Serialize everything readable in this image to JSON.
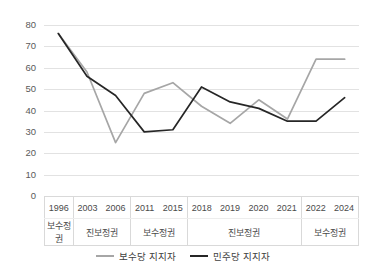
{
  "chart_data": {
    "type": "line",
    "title": "",
    "xlabel": "",
    "ylabel": "",
    "ylim": [
      0,
      80
    ],
    "ytick_step": 10,
    "ytick_labels": [
      "80",
      "70",
      "60",
      "50",
      "40",
      "30",
      "20",
      "10",
      "0"
    ],
    "grid": true,
    "legend_position": "bottom",
    "categories": [
      "1996",
      "2003",
      "2006",
      "2011",
      "2015",
      "2018",
      "2019",
      "2020",
      "2021",
      "2022",
      "2024"
    ],
    "group_bands": [
      {
        "label": "보수정권",
        "categories": [
          "1996"
        ]
      },
      {
        "label": "진보정권",
        "categories": [
          "2003",
          "2006"
        ]
      },
      {
        "label": "보수정권",
        "categories": [
          "2011",
          "2015"
        ]
      },
      {
        "label": "진보정권",
        "categories": [
          "2018",
          "2019",
          "2020",
          "2021"
        ]
      },
      {
        "label": "보수정권",
        "categories": [
          "2022",
          "2024"
        ]
      }
    ],
    "series": [
      {
        "name": "보수당 지지자",
        "color": "#a6a6a6",
        "values": [
          76,
          58,
          25,
          48,
          53,
          42,
          34,
          45,
          36,
          64,
          64
        ]
      },
      {
        "name": "민주당 지지자",
        "color": "#262626",
        "values": [
          76,
          56,
          47,
          30,
          31,
          51,
          44,
          41,
          35,
          35,
          46
        ]
      }
    ]
  },
  "legend": {
    "items": [
      {
        "label": "보수당 지지자",
        "color": "#a6a6a6"
      },
      {
        "label": "민주당 지지자",
        "color": "#262626"
      }
    ]
  },
  "axis": {
    "y_labels": [
      "80",
      "70",
      "60",
      "50",
      "40",
      "30",
      "20",
      "10",
      "0"
    ]
  }
}
